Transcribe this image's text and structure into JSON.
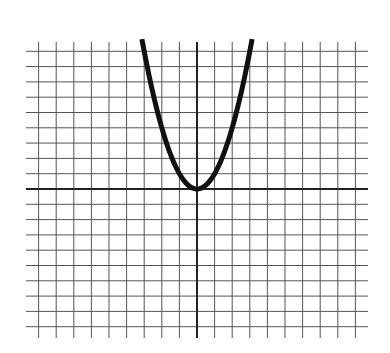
{
  "chart_data": {
    "type": "line",
    "title": "",
    "xlabel": "",
    "ylabel": "",
    "function": "y = x^2",
    "series": [
      {
        "name": "parabola",
        "x": [
          -3.1,
          -3,
          -2.5,
          -2,
          -1.5,
          -1,
          -0.5,
          0,
          0.5,
          1,
          1.5,
          2,
          2.5,
          3,
          3.1
        ],
        "y": [
          9.61,
          9,
          6.25,
          4,
          2.25,
          1,
          0.25,
          0,
          0.25,
          1,
          2.25,
          4,
          6.25,
          9,
          9.61
        ]
      }
    ],
    "xlim": [
      -9.6,
      9.6
    ],
    "ylim": [
      -9.6,
      9.6
    ],
    "grid": true,
    "grid_lines_x": 19,
    "grid_lines_y": 19,
    "tick_labels": false,
    "legend": false,
    "colors": {
      "curve": "#111111",
      "grid": "#555555",
      "axis": "#222222",
      "background": "#ffffff"
    }
  }
}
